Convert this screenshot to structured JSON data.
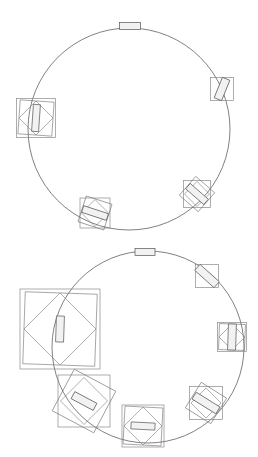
{
  "document": {
    "caption_top": "",
    "caption_bottom": "",
    "background_color": "#ffffff",
    "stroke_color": "#4a4a4a",
    "fill_color": "#f2f2f2"
  },
  "figures": [
    {
      "id": "top-figure",
      "name": "circle-diagram-small-boxes",
      "origin": {
        "x": 0,
        "y": 8
      },
      "circle": {
        "cx": 129,
        "cy": 121,
        "r": 101
      },
      "nodes": [
        {
          "name": "node-top",
          "angle_deg": 90,
          "cx": 130,
          "cy": 18,
          "bbox": 0,
          "rot_square": 0,
          "body": {
            "w": 21,
            "h": 7,
            "rot": 0
          }
        },
        {
          "name": "node-right",
          "angle_deg": 23,
          "cx": 222,
          "cy": 81,
          "bbox": 23,
          "rot_square": 0,
          "body": {
            "w": 8,
            "h": 22,
            "rot": 22
          }
        },
        {
          "name": "node-left",
          "angle_deg": 186,
          "cx": 36,
          "cy": 110,
          "bbox": 39,
          "rot_square": 34,
          "body": {
            "w": 7,
            "h": 27,
            "rot": 4
          }
        },
        {
          "name": "node-bottom-right",
          "angle_deg": -38,
          "cx": 197,
          "cy": 186,
          "bbox": 27,
          "rot_square": 25,
          "body": {
            "w": 7,
            "h": 24,
            "rot": 131
          }
        },
        {
          "name": "node-bottom-left",
          "angle_deg": -118,
          "cx": 95,
          "cy": 205,
          "bbox": 30,
          "rot_square": 27,
          "body": {
            "w": 7,
            "h": 26,
            "rot": 108
          }
        }
      ]
    },
    {
      "id": "bottom-figure",
      "name": "circle-diagram-large-boxes",
      "origin": {
        "x": 0,
        "y": 243
      },
      "circle": {
        "cx": 148,
        "cy": 104,
        "r": 96
      },
      "nodes": [
        {
          "name": "node-top",
          "angle_deg": 90,
          "cx": 145,
          "cy": 9,
          "bbox": 0,
          "rot_square": 0,
          "body": {
            "w": 20,
            "h": 7,
            "rot": 0
          }
        },
        {
          "name": "node-upper-right",
          "angle_deg": 43,
          "cx": 207,
          "cy": 33,
          "bbox": 23,
          "rot_square": 0,
          "body": {
            "w": 8,
            "h": 26,
            "rot": 132
          }
        },
        {
          "name": "node-right",
          "angle_deg": 0,
          "cx": 232,
          "cy": 94,
          "bbox": 29,
          "rot_square": 26,
          "body": {
            "w": 8,
            "h": 26,
            "rot": 2
          }
        },
        {
          "name": "node-lower-right",
          "angle_deg": -40,
          "cx": 206,
          "cy": 160,
          "bbox": 33,
          "rot_square": 30,
          "body": {
            "w": 8,
            "h": 28,
            "rot": 122
          }
        },
        {
          "name": "node-bottom",
          "angle_deg": -80,
          "cx": 143,
          "cy": 183,
          "bbox": 42,
          "rot_square": 38,
          "body": {
            "w": 24,
            "h": 7,
            "rot": 3
          }
        },
        {
          "name": "node-lower-left",
          "angle_deg": -140,
          "cx": 84,
          "cy": 158,
          "bbox": 52,
          "rot_square": 47,
          "body": {
            "w": 25,
            "h": 8,
            "rot": 28
          }
        },
        {
          "name": "node-left",
          "angle_deg": 175,
          "cx": 60,
          "cy": 86,
          "bbox": 80,
          "rot_square": 72,
          "body": {
            "w": 8,
            "h": 26,
            "rot": 2
          }
        }
      ]
    }
  ]
}
